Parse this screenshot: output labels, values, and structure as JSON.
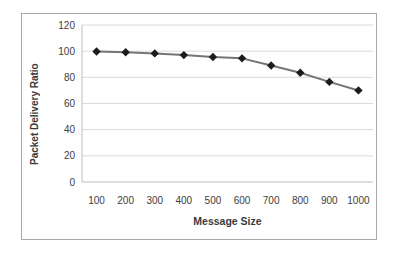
{
  "chart_data": {
    "type": "line",
    "title": "",
    "xlabel": "Message Size",
    "ylabel": "Packet Delivery Ratio",
    "categories": [
      100,
      200,
      300,
      400,
      500,
      600,
      700,
      800,
      900,
      1000
    ],
    "series": [
      {
        "name": "Packet Delivery Ratio",
        "values": [
          99.8,
          99.2,
          98.3,
          97.0,
          95.5,
          94.5,
          89.0,
          83.5,
          76.5,
          70.0
        ],
        "line_color": "#757575",
        "marker": "diamond",
        "marker_color": "#1c1c1c"
      }
    ],
    "ylim": [
      0,
      120
    ],
    "ytick_step": 20,
    "yticks": [
      0,
      20,
      40,
      60,
      80,
      100,
      120
    ],
    "grid": "horizontal",
    "legend": "none",
    "colors": {
      "gridline": "#dbdbdb",
      "axis_line": "#bdbdbd",
      "tick_text": "#3d3d3d",
      "frame_border": "#a8a8a8",
      "background": "#ffffff"
    }
  }
}
